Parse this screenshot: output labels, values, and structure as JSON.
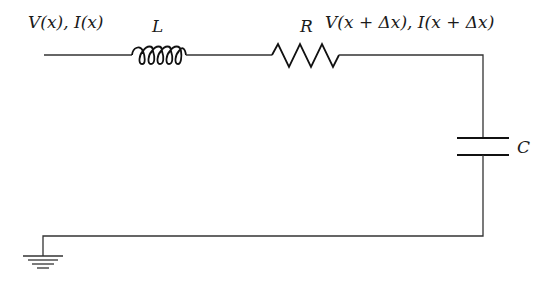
{
  "diagram": {
    "type": "circuit",
    "colors": {
      "background": "#ffffff",
      "wire": "#333333",
      "component": "#111111",
      "text": "#1a1a1a"
    },
    "labels": {
      "input_node": "V(x), I(x)",
      "inductor": "L",
      "resistor": "R",
      "output_node": "V(x + Δx), I(x + Δx)",
      "capacitor": "C"
    },
    "components": [
      {
        "id": "inductor",
        "symbol": "coil",
        "label": "L"
      },
      {
        "id": "resistor",
        "symbol": "zigzag",
        "label": "R"
      },
      {
        "id": "capacitor",
        "symbol": "parallel-plates",
        "label": "C"
      },
      {
        "id": "ground",
        "symbol": "ground",
        "label": ""
      }
    ]
  }
}
